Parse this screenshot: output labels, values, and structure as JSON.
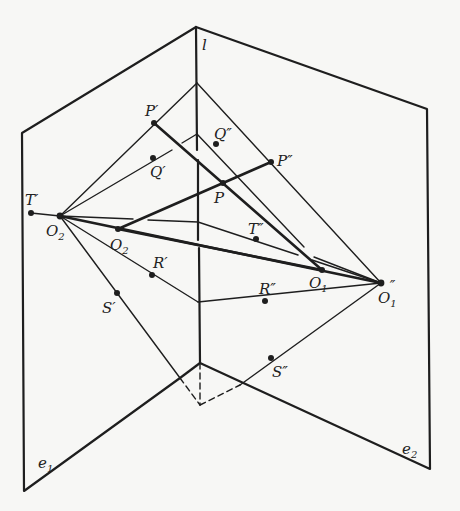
{
  "figure": {
    "planes": [
      {
        "name": "e1",
        "label": "e",
        "sub": "1"
      },
      {
        "name": "e2",
        "label": "e",
        "sub": "2"
      }
    ],
    "axis": {
      "name": "l",
      "label": "l"
    },
    "points": [
      {
        "id": "P1",
        "label": "P",
        "mark": "′",
        "x": 154,
        "y": 123
      },
      {
        "id": "Q1",
        "label": "Q",
        "mark": "′",
        "x": 153,
        "y": 158
      },
      {
        "id": "Q2",
        "label": "Q",
        "mark": "″",
        "x": 216,
        "y": 144
      },
      {
        "id": "P2",
        "label": "P",
        "mark": "″",
        "x": 271,
        "y": 162
      },
      {
        "id": "P",
        "label": "P",
        "mark": "",
        "x": 223,
        "y": 183
      },
      {
        "id": "T1",
        "label": "T",
        "mark": "′",
        "x": 31,
        "y": 213
      },
      {
        "id": "O2p",
        "label": "O",
        "sub": "2",
        "mark": "′",
        "x": 60,
        "y": 216
      },
      {
        "id": "O2",
        "label": "O",
        "sub": "2",
        "mark": "",
        "x": 118,
        "y": 229
      },
      {
        "id": "T2",
        "label": "T",
        "mark": "″",
        "x": 256,
        "y": 239
      },
      {
        "id": "O1",
        "label": "O",
        "sub": "1",
        "mark": "",
        "x": 322,
        "y": 270
      },
      {
        "id": "O1pp",
        "label": "O",
        "sub": "1",
        "mark": "″",
        "x": 381,
        "y": 283
      },
      {
        "id": "R1",
        "label": "R",
        "mark": "′",
        "x": 152,
        "y": 275
      },
      {
        "id": "R2",
        "label": "R",
        "mark": "″",
        "x": 265,
        "y": 301
      },
      {
        "id": "S1",
        "label": "S",
        "mark": "′",
        "x": 117,
        "y": 293
      },
      {
        "id": "S2",
        "label": "S",
        "mark": "″",
        "x": 271,
        "y": 358
      }
    ],
    "colors": {
      "ink": "#1e1e1e",
      "background": "#f7f7f5"
    }
  },
  "labels": {
    "l": "l",
    "e1": "e",
    "e1_sub": "1",
    "e2": "e",
    "e2_sub": "2",
    "P1": "P′",
    "Q1": "Q′",
    "Q2": "Q″",
    "P2": "P″",
    "P": "P",
    "T1": "T′",
    "T2": "T″",
    "O2p": "O",
    "O2p_sub": "2",
    "O2p_mark": "′",
    "O2": "O",
    "O2_sub": "2",
    "O1": "O",
    "O1_sub": "1",
    "O1pp": "O",
    "O1pp_sub": "1",
    "O1pp_mark": "″",
    "R1": "R′",
    "R2": "R″",
    "S1": "S′",
    "S2": "S″"
  }
}
